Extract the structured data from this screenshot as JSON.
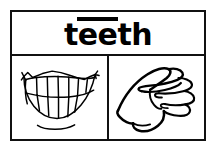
{
  "card": {
    "headword": "teeth",
    "headword_segments": [
      {
        "text": "t",
        "long_vowel": false
      },
      {
        "text": "ee",
        "long_vowel": true
      },
      {
        "text": "th",
        "long_vowel": false
      }
    ],
    "pronunciation_mark": "macron",
    "line_color": "#111111",
    "ink_color": "#000000",
    "background_color": "#ffffff"
  },
  "panels": {
    "left": {
      "name": "mouth-teeth-illustration",
      "caption": "open smiling mouth showing rows of teeth"
    },
    "right": {
      "name": "sign-language-hand-illustration",
      "caption": "hand with index finger extended pointing toward the teeth"
    }
  }
}
